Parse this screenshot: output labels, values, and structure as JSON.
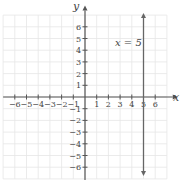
{
  "chart_data": {
    "type": "line",
    "title": "",
    "xlabel": "x",
    "ylabel": "y",
    "xlim": [
      -7,
      7
    ],
    "ylim": [
      -7,
      7
    ],
    "x_ticks": [
      -6,
      -5,
      -4,
      -3,
      -2,
      -1,
      1,
      2,
      3,
      4,
      5,
      6
    ],
    "y_ticks": [
      6,
      5,
      4,
      3,
      2,
      1,
      -1,
      -2,
      -3,
      -4,
      -5,
      -6
    ],
    "grid": true,
    "series": [
      {
        "name": "x = 5",
        "type": "vertical_line",
        "x": 5,
        "y_range": [
          -7,
          7
        ]
      }
    ],
    "annotations": [
      {
        "text": "x = 5",
        "x": 3.2,
        "y": 4.5
      }
    ]
  },
  "labels": {
    "x_axis": "x",
    "y_axis": "y",
    "equation": "x = 5"
  },
  "colors": {
    "axis": "#555555",
    "grid": "#e6e6e6",
    "line": "#666666"
  }
}
